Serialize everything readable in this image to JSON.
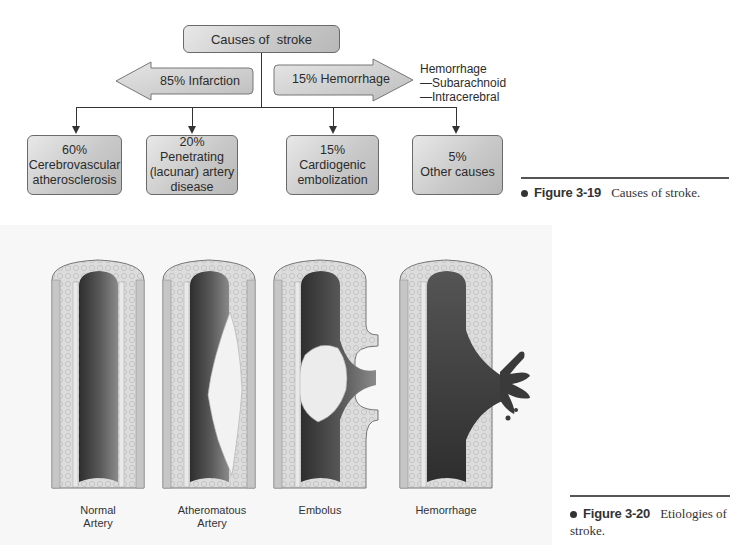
{
  "figure_3_19": {
    "root": "Causes of  stroke",
    "left_arrow": "85% Infarction",
    "right_arrow": "15% Hemorrhage",
    "hemorrhage_types": {
      "title": "Hemorrhage",
      "items": [
        "—Subarachnoid",
        "—Intracerebral"
      ]
    },
    "causes": [
      {
        "percent": "60%",
        "lines": [
          "Cerebrovascular",
          "atherosclerosis"
        ]
      },
      {
        "percent": "20%",
        "lines": [
          "Penetrating",
          "(lacunar) artery",
          "disease"
        ]
      },
      {
        "percent": "15%",
        "lines": [
          "Cardiogenic",
          "embolization"
        ]
      },
      {
        "percent": "5%",
        "lines": [
          "Other causes"
        ]
      }
    ],
    "caption": {
      "number": "Figure 3-19",
      "text": "Causes of stroke."
    }
  },
  "figure_3_20": {
    "arteries": [
      {
        "label_line1": "Normal",
        "label_line2": "Artery"
      },
      {
        "label_line1": "Atheromatous",
        "label_line2": "Artery"
      },
      {
        "label_line1": "Embolus",
        "label_line2": ""
      },
      {
        "label_line1": "Hemorrhage",
        "label_line2": ""
      }
    ],
    "caption": {
      "number": "Figure 3-20",
      "text_line1": "Etiologies of",
      "text_line2": "stroke."
    }
  },
  "colors": {
    "box_fill_light": "#e8e8e8",
    "box_fill_dark": "#b8b8b8",
    "lumen_dark": "#3a3a3a",
    "wall_light": "#d8d8d8",
    "plaque": "#f2f2f2"
  }
}
